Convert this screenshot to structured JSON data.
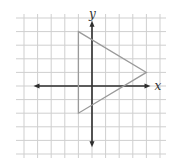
{
  "diagram": {
    "type": "coordinate-plane",
    "grid": {
      "x_range": [
        -5,
        5
      ],
      "y_range": [
        -5,
        5
      ],
      "origin_px": [
        92,
        86
      ],
      "cell_px": 13.6,
      "color": "#cfcfcf"
    },
    "axes": {
      "x_label": "x",
      "y_label": "y",
      "color": "#2e2e2e"
    },
    "shape": {
      "name": "triangle",
      "vertices": [
        [
          -1,
          4
        ],
        [
          4,
          1
        ],
        [
          -1,
          -2
        ]
      ],
      "stroke": "#9a9a9a"
    }
  }
}
